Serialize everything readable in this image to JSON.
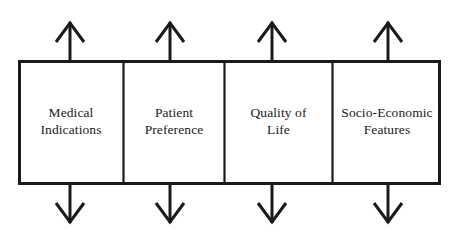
{
  "diagram": {
    "type": "four-box-framework-diagram",
    "title": "",
    "colors": {
      "background": "#ffffff",
      "stroke": "#1a1a1a",
      "box_fill": "#ffffff",
      "text": "#1a1a1a"
    },
    "band": {
      "x": 18,
      "y": 60,
      "width": 423,
      "height": 125,
      "outer_stroke_width": 3,
      "divider_stroke_width": 2.2
    },
    "boxes": [
      {
        "id": "medical-indications",
        "label": "Medical\nIndications",
        "label_line1": "Medical",
        "label_line2": "Indications",
        "x": 18,
        "width": 105,
        "arrow_x": 70
      },
      {
        "id": "patient-preference",
        "label": "Patient\nPreference",
        "label_line1": "Patient",
        "label_line2": "Preference",
        "x": 123,
        "width": 101,
        "arrow_x": 170
      },
      {
        "id": "quality-of-life",
        "label": "Quality of\nLife",
        "label_line1": "Quality of",
        "label_line2": "Life",
        "x": 224,
        "width": 108,
        "arrow_x": 272
      },
      {
        "id": "socio-economic-features",
        "label": "Socio-Economic\nFeatures",
        "label_line1": "Socio-Economic",
        "label_line2": "Features",
        "x": 332,
        "width": 109,
        "arrow_x": 388
      }
    ],
    "arrows": {
      "up": {
        "direction": "up",
        "stem_top_y": 22,
        "stem_bottom_y": 60,
        "head_half_width": 14,
        "head_height": 20,
        "stroke_width": 3
      },
      "down": {
        "direction": "down",
        "stem_top_y": 185,
        "stem_bottom_y": 224,
        "head_half_width": 14,
        "head_height": 20,
        "stroke_width": 3
      }
    }
  }
}
